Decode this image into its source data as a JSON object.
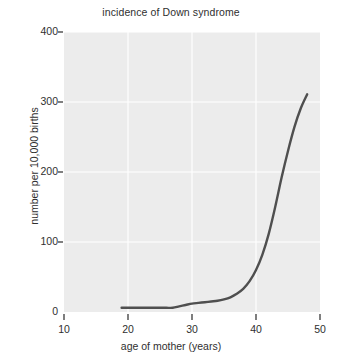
{
  "chart_data": {
    "type": "line",
    "title": "incidence of Down syndrome",
    "xlabel": "age of mother (years)",
    "ylabel": "number per 10,000 births",
    "xlim": [
      10,
      50
    ],
    "ylim": [
      0,
      400
    ],
    "xticks": [
      10,
      20,
      30,
      40,
      50
    ],
    "yticks": [
      0,
      100,
      200,
      300,
      400
    ],
    "xtick_labels": [
      "10",
      "20",
      "30",
      "40",
      "50"
    ],
    "ytick_labels": [
      "0",
      "100",
      "200",
      "300",
      "400"
    ],
    "grid": true,
    "legend": "none",
    "series": [
      {
        "name": "incidence",
        "color": "#4f4f4f",
        "x": [
          19,
          20,
          21,
          22,
          23,
          24,
          25,
          26,
          27,
          28,
          29,
          30,
          31,
          32,
          33,
          34,
          35,
          36,
          37,
          38,
          39,
          40,
          41,
          42,
          43,
          44,
          45,
          46,
          47,
          48
        ],
        "y": [
          6,
          6,
          6,
          6,
          6,
          6,
          6,
          6,
          6,
          8,
          10,
          12,
          13,
          14,
          15,
          16,
          18,
          21,
          26,
          33,
          44,
          60,
          82,
          112,
          150,
          192,
          230,
          264,
          291,
          311
        ]
      }
    ],
    "plot_bg": "#ececec",
    "grid_color": "#ffffff",
    "axis_color": "#3a3a3a"
  },
  "figure": {
    "plot_left_px": 64,
    "plot_right_px": 320,
    "plot_top_px": 32,
    "plot_bottom_px": 312
  }
}
